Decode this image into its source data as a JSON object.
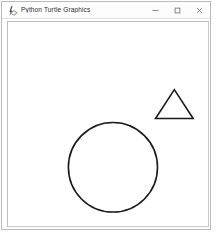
{
  "window": {
    "title": "Python Turtle Graphics",
    "icon": "python-turtle-icon",
    "frame_color": "#b9b9b9",
    "titlebar_color": "#fdfdfd",
    "controls": [
      {
        "name": "minimize-button",
        "glyph": "minimize-icon",
        "label": "Minimize"
      },
      {
        "name": "maximize-button",
        "glyph": "maximize-icon",
        "label": "Maximize"
      },
      {
        "name": "close-button",
        "glyph": "close-icon",
        "label": "Close"
      }
    ]
  },
  "canvas": {
    "name": "turtle-drawing-canvas",
    "background": "#ffffff",
    "pen_color": "#1a1a1a",
    "border_color": "#c8c8c8",
    "width": 202,
    "height": 205,
    "shapes": [
      {
        "name": "triangle-shape",
        "type": "polygon",
        "sides": 3,
        "stroke": "#1a1a1a",
        "stroke_width": 1.6,
        "fill": "none",
        "points": "174,89 193,118 155,118"
      },
      {
        "name": "circle-shape",
        "type": "circle",
        "stroke": "#1a1a1a",
        "stroke_width": 1.6,
        "fill": "none",
        "center_x": 112,
        "center_y": 167,
        "radius": 45
      }
    ]
  }
}
